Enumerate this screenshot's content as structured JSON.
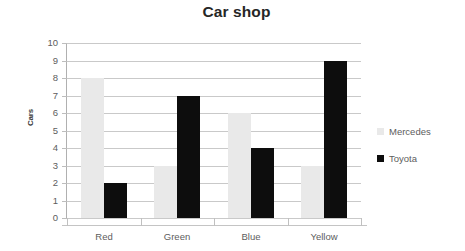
{
  "chart_data": {
    "type": "bar",
    "title": "Car shop",
    "xlabel": "",
    "ylabel": "Cars",
    "categories": [
      "Red",
      "Green",
      "Blue",
      "Yellow"
    ],
    "series": [
      {
        "name": "Mercedes",
        "color": "#e9e9e9",
        "values": [
          8,
          3,
          6,
          3
        ]
      },
      {
        "name": "Toyota",
        "color": "#0d0d0d",
        "values": [
          2,
          7,
          4,
          9
        ]
      }
    ],
    "ylim": [
      0,
      10
    ],
    "ytick_labels": [
      "10",
      "9",
      "8",
      "7",
      "6",
      "5",
      "4",
      "3",
      "2",
      "1",
      "0"
    ],
    "ytick_values": [
      10,
      9,
      8,
      7,
      6,
      5,
      4,
      3,
      2,
      1,
      0
    ],
    "grid": true,
    "grid_axis": "y",
    "legend_position": "right",
    "background_color": "#ffffff",
    "grid_color": "#c9c9c9",
    "text_color": "#5d5d5d"
  }
}
